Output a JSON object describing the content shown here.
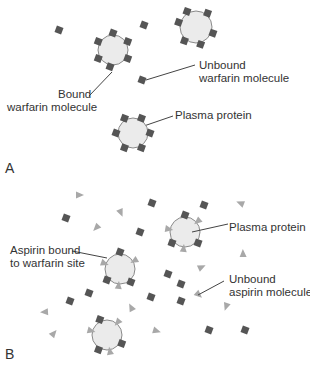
{
  "colors": {
    "protein_fill": "#ebebeb",
    "protein_stroke": "#8a8a8a",
    "warfarin": "#555555",
    "aspirin": "#a8a8a8",
    "line": "#444444",
    "text": "#333333"
  },
  "panel_a": {
    "letter": "A",
    "labels": {
      "bound_warfarin_1": "Bound",
      "bound_warfarin_2": "warfarin molecule",
      "unbound_warfarin_1": "Unbound",
      "unbound_warfarin_2": "warfarin molecule",
      "plasma_protein": "Plasma protein"
    },
    "proteins": [
      {
        "cx": 113,
        "cy": 50,
        "r": 15,
        "warfarin_angles": [
          -90,
          -30,
          30,
          100,
          150,
          210
        ]
      },
      {
        "cx": 196,
        "cy": 27,
        "r": 16,
        "warfarin_angles": [
          -120,
          -50,
          20,
          75,
          130,
          195
        ]
      },
      {
        "cx": 133,
        "cy": 133,
        "r": 15,
        "warfarin_angles": [
          -120,
          -60,
          0,
          60,
          120,
          180
        ]
      }
    ],
    "free_warfarin": [
      [
        59,
        30
      ],
      [
        144,
        25
      ],
      [
        142,
        80
      ]
    ],
    "leaders": [
      {
        "x1": 89,
        "y1": 96,
        "x2": 112,
        "y2": 72
      },
      {
        "x1": 195,
        "y1": 65,
        "x2": 146,
        "y2": 80
      },
      {
        "x1": 173,
        "y1": 116,
        "x2": 138,
        "y2": 128
      }
    ]
  },
  "panel_b": {
    "letter": "B",
    "labels": {
      "aspirin_bound_1": "Aspirin bound",
      "aspirin_bound_2": "to warfarin site",
      "plasma_protein": "Plasma protein",
      "unbound_aspirin_1": "Unbound",
      "unbound_aspirin_2": "aspirin molecule"
    },
    "proteins": [
      {
        "cx": 185,
        "cy": 232,
        "r": 15,
        "warfarin": [
          -90,
          40,
          140
        ],
        "aspirin": [
          -40,
          95,
          190
        ]
      },
      {
        "cx": 120,
        "cy": 269,
        "r": 15,
        "warfarin": [
          -90,
          50,
          140
        ],
        "aspirin": [
          -30,
          95,
          200
        ]
      },
      {
        "cx": 107,
        "cy": 335,
        "r": 15,
        "warfarin": [
          -115,
          30,
          120
        ],
        "aspirin": [
          -50,
          80,
          195
        ]
      }
    ],
    "free_warfarin": [
      [
        66,
        218
      ],
      [
        152,
        203
      ],
      [
        140,
        232
      ],
      [
        204,
        205
      ],
      [
        168,
        274
      ],
      [
        181,
        284
      ],
      [
        151,
        297
      ],
      [
        181,
        301
      ],
      [
        89,
        293
      ],
      [
        70,
        301
      ],
      [
        209,
        330
      ],
      [
        245,
        330
      ]
    ],
    "free_aspirin": [
      [
        80,
        195
      ],
      [
        121,
        213
      ],
      [
        96,
        228
      ],
      [
        240,
        203
      ],
      [
        243,
        253
      ],
      [
        202,
        267
      ],
      [
        199,
        295
      ],
      [
        226,
        307
      ],
      [
        44,
        312
      ],
      [
        131,
        307
      ],
      [
        54,
        333
      ],
      [
        157,
        331
      ]
    ],
    "leaders": [
      {
        "x1": 72,
        "y1": 251,
        "x2": 107,
        "y2": 258
      },
      {
        "x1": 228,
        "y1": 224,
        "x2": 192,
        "y2": 232
      },
      {
        "x1": 224,
        "y1": 281,
        "x2": 198,
        "y2": 295
      }
    ]
  }
}
